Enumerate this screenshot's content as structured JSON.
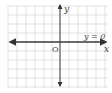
{
  "diagram": {
    "type": "coordinate-plane",
    "grid": {
      "cell_px": 9,
      "color": "#d4d4d4",
      "x_start": 8,
      "x_end": 108,
      "y_start": 8,
      "y_end": 88
    },
    "origin_px": {
      "x": 60,
      "y": 42
    },
    "axes": {
      "x_label": "x",
      "y_label": "y",
      "origin_label": "O",
      "color": "#333333"
    },
    "line": {
      "equation_label": "y = 0",
      "color": "#3a3a3a"
    }
  }
}
